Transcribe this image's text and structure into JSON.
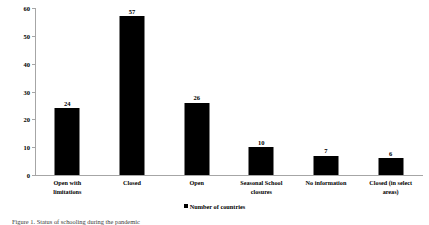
{
  "chart_data": {
    "type": "bar",
    "title": "",
    "subtitle": "",
    "xlabel": "",
    "ylabel": "",
    "ylim": [
      0,
      60
    ],
    "yticks": [
      0,
      10,
      20,
      30,
      40,
      50,
      60
    ],
    "grid": false,
    "legend_position": "bottom-center",
    "categories": [
      "Open with limitations",
      "Closed",
      "Open",
      "Seasonal School closures",
      "No information",
      "Closed (in select areas)"
    ],
    "category_lines": [
      [
        "Open with",
        "limitations"
      ],
      [
        "Closed"
      ],
      [
        "Open"
      ],
      [
        "Seasonal School",
        "closures"
      ],
      [
        "No information"
      ],
      [
        "Closed (in select",
        "areas)"
      ]
    ],
    "values": [
      24,
      57,
      26,
      10,
      7,
      6
    ],
    "series": [
      {
        "name": "Number of countries",
        "values": [
          24,
          57,
          26,
          10,
          7,
          6
        ],
        "color": "#000000"
      }
    ],
    "legend": [
      "Number of countries"
    ],
    "bar_color": "#000000",
    "axis_color": "#A6A6A6"
  },
  "legend": {
    "label": "Number of countries",
    "marker": "square-marker"
  },
  "caption": {
    "text": "Figure 1. Status of schooling during the pandemic"
  }
}
